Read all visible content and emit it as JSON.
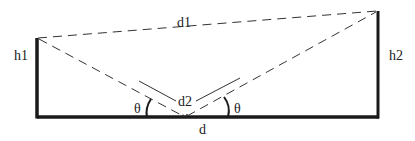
{
  "diagram": {
    "labels": {
      "d1": "d1",
      "d2": "d2",
      "d": "d",
      "h1": "h1",
      "h2": "h2",
      "theta_left": "θ",
      "theta_right": "θ"
    },
    "colors": {
      "line": "#1a1a1a",
      "background": "#ffffff"
    }
  }
}
